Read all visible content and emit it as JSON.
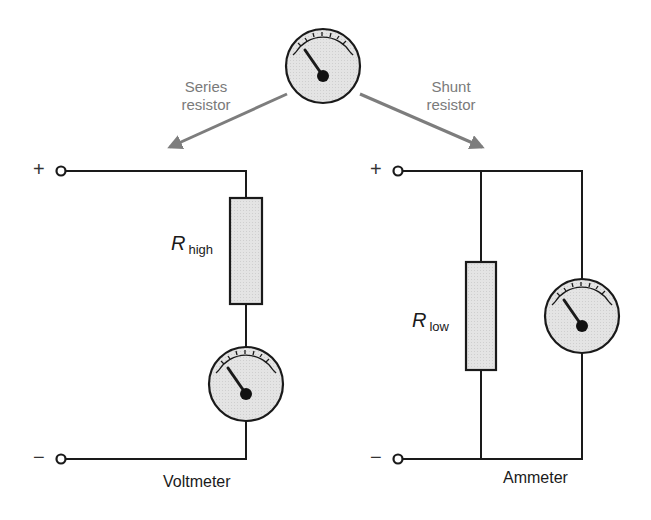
{
  "diagram": {
    "colors": {
      "wire": "#1a1a1a",
      "arrow": "#7d7d7d",
      "component_fill": "#e2e2e2",
      "needle_hub": "#111111",
      "label_gray": "#7a7a7a"
    },
    "top_meter": {
      "name": "galvanometer",
      "icon": "meter-icon"
    },
    "arrows": {
      "left_label_line1": "Series",
      "left_label_line2": "resistor",
      "right_label_line1": "Shunt",
      "right_label_line2": "resistor"
    },
    "voltmeter_circuit": {
      "plus_terminal": "+",
      "minus_terminal": "−",
      "resistor_symbol": "R",
      "resistor_subscript": "high",
      "caption": "Voltmeter",
      "meter_icon": "meter-icon"
    },
    "ammeter_circuit": {
      "plus_terminal": "+",
      "minus_terminal": "−",
      "resistor_symbol": "R",
      "resistor_subscript": "low",
      "caption": "Ammeter",
      "meter_icon": "meter-icon"
    }
  }
}
